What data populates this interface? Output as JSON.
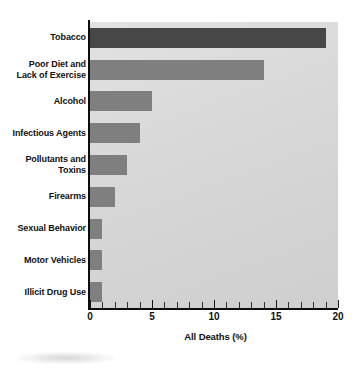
{
  "chart_data": {
    "type": "bar",
    "orientation": "horizontal",
    "title": "",
    "xlabel": "All Deaths (%)",
    "ylabel": "",
    "xlim": [
      0,
      20
    ],
    "xticks": [
      0,
      5,
      10,
      15,
      20
    ],
    "xtick_labels": [
      "0",
      "5",
      "10",
      "15",
      "20"
    ],
    "minor_tick_interval": 1,
    "grid": false,
    "legend": null,
    "categories": [
      "Tobacco",
      "Poor Diet and\nLack of Exercise",
      "Alcohol",
      "Infectious Agents",
      "Pollutants and\nToxins",
      "Firearms",
      "Sexual Behavior",
      "Motor Vehicles",
      "Illicit Drug Use"
    ],
    "values": [
      19,
      14,
      5,
      4,
      3,
      2,
      1,
      1,
      1
    ],
    "bar_colors": [
      "#474747",
      "#7f7f7f",
      "#7f7f7f",
      "#7f7f7f",
      "#7f7f7f",
      "#7f7f7f",
      "#7f7f7f",
      "#7f7f7f",
      "#7f7f7f"
    ],
    "plot_background": "#d8d8d8",
    "axis_color": "#0d0d0d",
    "highlight_color": "#474747",
    "bar_color": "#7f7f7f"
  }
}
